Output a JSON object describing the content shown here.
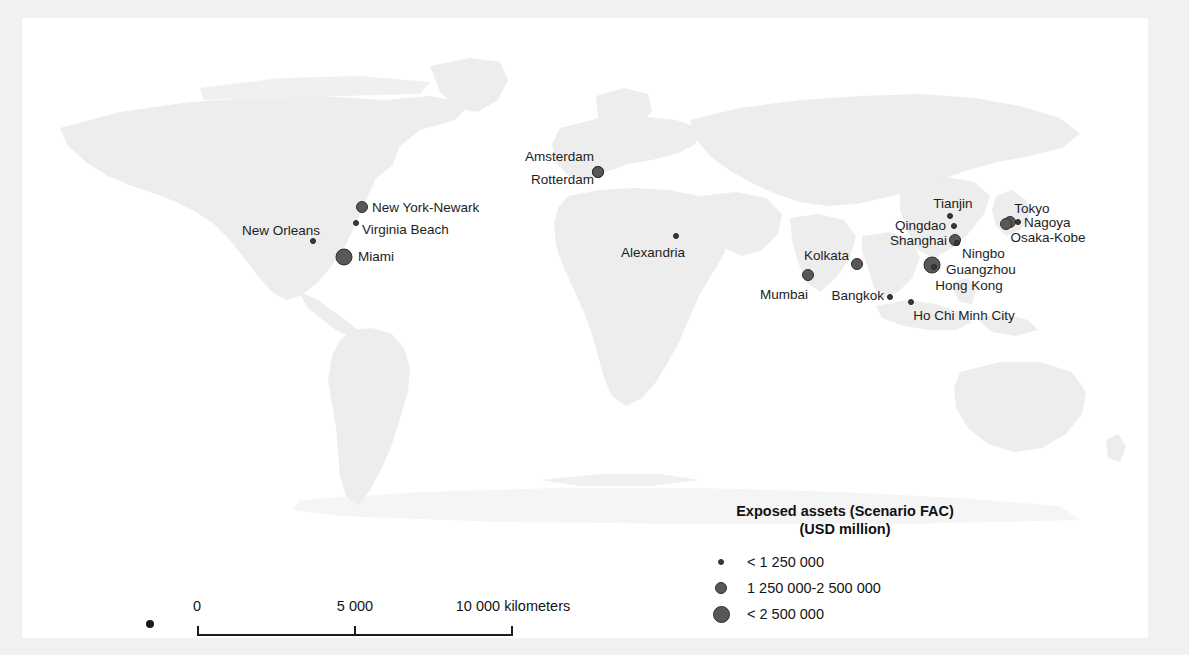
{
  "title_clipped": "",
  "map": {
    "name": "world-map",
    "background_color": "#ffffff",
    "land_color": "#ededee",
    "marker_color": "#585858",
    "marker_outline_color": "#2e2e2e"
  },
  "cities": [
    {
      "name": "New Orleans",
      "label": "New Orleans",
      "x": 313,
      "y": 241,
      "size": "small",
      "label_side": "left",
      "label_x": 320,
      "label_y": 231
    },
    {
      "name": "New York-Newark",
      "label": "New York-Newark",
      "x": 362,
      "y": 207,
      "size": "medium",
      "label_side": "right",
      "label_x": 372,
      "label_y": 208
    },
    {
      "name": "Virginia Beach",
      "label": "Virginia Beach",
      "x": 356,
      "y": 223,
      "size": "small",
      "label_side": "right",
      "label_x": 362,
      "label_y": 230
    },
    {
      "name": "Miami",
      "label": "Miami",
      "x": 344,
      "y": 257,
      "size": "large",
      "label_side": "right",
      "label_x": 358,
      "label_y": 257
    },
    {
      "name": "Amsterdam",
      "label": "Amsterdam",
      "x": 598,
      "y": 172,
      "size": "medium",
      "label_side": "left",
      "label_x": 594,
      "label_y": 157
    },
    {
      "name": "Rotterdam",
      "label": "Rotterdam",
      "x": 598,
      "y": 172,
      "size": "medium",
      "label_side": "left",
      "label_x": 594,
      "label_y": 180
    },
    {
      "name": "Alexandria",
      "label": "Alexandria",
      "x": 676,
      "y": 236,
      "size": "small",
      "label_side": "center",
      "label_x": 653,
      "label_y": 253
    },
    {
      "name": "Mumbai",
      "label": "Mumbai",
      "x": 808,
      "y": 275,
      "size": "medium",
      "label_side": "center",
      "label_x": 784,
      "label_y": 295
    },
    {
      "name": "Kolkata",
      "label": "Kolkata",
      "x": 857,
      "y": 264,
      "size": "medium",
      "label_side": "left",
      "label_x": 849,
      "label_y": 256
    },
    {
      "name": "Bangkok",
      "label": "Bangkok",
      "x": 890,
      "y": 297,
      "size": "small",
      "label_side": "left",
      "label_x": 884,
      "label_y": 296
    },
    {
      "name": "Ho Chi Minh City",
      "label": "Ho Chi Minh City",
      "x": 911,
      "y": 302,
      "size": "small",
      "label_side": "center",
      "label_x": 964,
      "label_y": 316
    },
    {
      "name": "Tianjin",
      "label": "Tianjin",
      "x": 950,
      "y": 216,
      "size": "small",
      "label_side": "center",
      "label_x": 953,
      "label_y": 204
    },
    {
      "name": "Qingdao",
      "label": "Qingdao",
      "x": 954,
      "y": 226,
      "size": "small",
      "label_side": "left",
      "label_x": 946,
      "label_y": 226
    },
    {
      "name": "Shanghai",
      "label": "Shanghai",
      "x": 955,
      "y": 240,
      "size": "medium",
      "label_side": "left",
      "label_x": 947,
      "label_y": 241
    },
    {
      "name": "Ningbo",
      "label": "Ningbo",
      "x": 957,
      "y": 243,
      "size": "small",
      "label_side": "right",
      "label_x": 962,
      "label_y": 254
    },
    {
      "name": "Guangzhou",
      "label": "Guangzhou",
      "x": 932,
      "y": 265,
      "size": "large",
      "label_side": "right",
      "label_x": 946,
      "label_y": 270
    },
    {
      "name": "Hong Kong",
      "label": "Hong Kong",
      "x": 934,
      "y": 267,
      "size": "small",
      "label_side": "center",
      "label_x": 969,
      "label_y": 286
    },
    {
      "name": "Tokyo",
      "label": "Tokyo",
      "x": 1010,
      "y": 222,
      "size": "medium",
      "label_side": "center",
      "label_x": 1032,
      "label_y": 209
    },
    {
      "name": "Nagoya",
      "label": "Nagoya",
      "x": 1018,
      "y": 222,
      "size": "small",
      "label_side": "right",
      "label_x": 1024,
      "label_y": 223
    },
    {
      "name": "Osaka-Kobe",
      "label": "Osaka-Kobe",
      "x": 1006,
      "y": 224,
      "size": "medium",
      "label_side": "center",
      "label_x": 1048,
      "label_y": 238
    }
  ],
  "legend": {
    "title_line1": "Exposed assets (Scenario FAC)",
    "title_line2": "(USD million)",
    "items": [
      {
        "size": "small",
        "label": "< 1 250 000"
      },
      {
        "size": "medium",
        "label": "1 250 000-2 500 000"
      },
      {
        "size": "large",
        "label": "< 2 500 000"
      }
    ]
  },
  "scalebar": {
    "start": "0",
    "middle": "5 000",
    "end": "10 000 kilometers"
  },
  "chart_data": {
    "type": "map",
    "title": "Exposed assets (Scenario FAC) (USD million)",
    "legend_position": "bottom-right",
    "categories": [
      "< 1 250 000",
      "1 250 000-2 500 000",
      "< 2 500 000"
    ],
    "points": [
      {
        "city": "New Orleans",
        "class": "< 1 250 000"
      },
      {
        "city": "New York-Newark",
        "class": "1 250 000-2 500 000"
      },
      {
        "city": "Virginia Beach",
        "class": "< 1 250 000"
      },
      {
        "city": "Miami",
        "class": "< 2 500 000"
      },
      {
        "city": "Amsterdam",
        "class": "1 250 000-2 500 000"
      },
      {
        "city": "Rotterdam",
        "class": "1 250 000-2 500 000"
      },
      {
        "city": "Alexandria",
        "class": "< 1 250 000"
      },
      {
        "city": "Mumbai",
        "class": "1 250 000-2 500 000"
      },
      {
        "city": "Kolkata",
        "class": "1 250 000-2 500 000"
      },
      {
        "city": "Bangkok",
        "class": "< 1 250 000"
      },
      {
        "city": "Ho Chi Minh City",
        "class": "< 1 250 000"
      },
      {
        "city": "Tianjin",
        "class": "< 1 250 000"
      },
      {
        "city": "Qingdao",
        "class": "< 1 250 000"
      },
      {
        "city": "Shanghai",
        "class": "1 250 000-2 500 000"
      },
      {
        "city": "Ningbo",
        "class": "< 1 250 000"
      },
      {
        "city": "Guangzhou",
        "class": "< 2 500 000"
      },
      {
        "city": "Hong Kong",
        "class": "< 1 250 000"
      },
      {
        "city": "Tokyo",
        "class": "1 250 000-2 500 000"
      },
      {
        "city": "Nagoya",
        "class": "< 1 250 000"
      },
      {
        "city": "Osaka-Kobe",
        "class": "1 250 000-2 500 000"
      }
    ],
    "scalebar_ticks": [
      "0",
      "5 000",
      "10 000 kilometers"
    ]
  }
}
